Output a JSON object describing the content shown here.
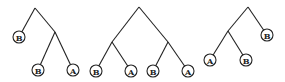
{
  "trees": [
    {
      "root": [
        35,
        8
      ],
      "internal": [
        [
          55,
          32
        ]
      ],
      "edges": [
        [
          [
            35,
            8
          ],
          [
            19,
            37
          ]
        ],
        [
          [
            35,
            8
          ],
          [
            55,
            32
          ]
        ],
        [
          [
            55,
            32
          ],
          [
            38,
            70
          ]
        ],
        [
          [
            55,
            32
          ],
          [
            73,
            70
          ]
        ]
      ],
      "leaves": [
        {
          "label": "B",
          "x": 19,
          "y": 37
        },
        {
          "label": "B",
          "x": 38,
          "y": 70
        },
        {
          "label": "A",
          "x": 73,
          "y": 70
        }
      ]
    },
    {
      "root": [
        139,
        7
      ],
      "internal": [
        [
          112,
          42
        ],
        [
          168,
          42
        ]
      ],
      "edges": [
        [
          [
            139,
            7
          ],
          [
            112,
            42
          ]
        ],
        [
          [
            139,
            7
          ],
          [
            168,
            42
          ]
        ],
        [
          [
            112,
            42
          ],
          [
            96,
            71
          ]
        ],
        [
          [
            112,
            42
          ],
          [
            131,
            71
          ]
        ],
        [
          [
            168,
            42
          ],
          [
            153,
            71
          ]
        ],
        [
          [
            168,
            42
          ],
          [
            188,
            71
          ]
        ]
      ],
      "leaves": [
        {
          "label": "B",
          "x": 96,
          "y": 71
        },
        {
          "label": "A",
          "x": 131,
          "y": 71
        },
        {
          "label": "B",
          "x": 153,
          "y": 71
        },
        {
          "label": "A",
          "x": 188,
          "y": 71
        }
      ]
    },
    {
      "root": [
        248,
        7
      ],
      "internal": [
        [
          228,
          31
        ]
      ],
      "edges": [
        [
          [
            248,
            7
          ],
          [
            228,
            31
          ]
        ],
        [
          [
            248,
            7
          ],
          [
            267,
            35
          ]
        ],
        [
          [
            228,
            31
          ],
          [
            210,
            60
          ]
        ],
        [
          [
            228,
            31
          ],
          [
            246,
            60
          ]
        ]
      ],
      "leaves": [
        {
          "label": "B",
          "x": 267,
          "y": 35
        },
        {
          "label": "A",
          "x": 210,
          "y": 60
        },
        {
          "label": "B",
          "x": 246,
          "y": 60
        }
      ]
    }
  ]
}
